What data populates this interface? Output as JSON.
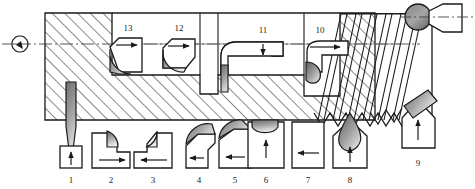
{
  "diagram": {
    "type": "engineering-sectional-drawing",
    "colors": {
      "outline": "#1a1a1a",
      "hatch": "#2b2b2b",
      "insert_dark": "#6d6d6d",
      "insert_light": "#e8e8e8",
      "centerline": "#444444",
      "background": "#ffffff"
    },
    "axis": {
      "centerline_label": "",
      "symbol": "center-mark"
    },
    "workpiece": {
      "section_hatch": "45-degree-hatch",
      "features": [
        "bore",
        "counterbore",
        "groove",
        "thread",
        "chamfer",
        "ball-end"
      ]
    },
    "tools_bottom": [
      {
        "id": "1",
        "label": "1",
        "feed": "up",
        "kind": "drill"
      },
      {
        "id": "2",
        "label": "2",
        "feed": "right",
        "kind": "round-insert-turning"
      },
      {
        "id": "3",
        "label": "3",
        "feed": "right",
        "kind": "round-insert-turning"
      },
      {
        "id": "4",
        "label": "4",
        "feed": "left",
        "kind": "round-insert-facing"
      },
      {
        "id": "5",
        "label": "5",
        "feed": "left",
        "kind": "round-insert-facing"
      },
      {
        "id": "6",
        "label": "6",
        "feed": "up",
        "kind": "form-tool-concave"
      },
      {
        "id": "7",
        "label": "7",
        "feed": "left",
        "kind": "grooving-tool"
      },
      {
        "id": "8",
        "label": "8",
        "feed": "up",
        "kind": "thread-chaser"
      },
      {
        "id": "9",
        "label": "9",
        "feed": "up",
        "kind": "chamfer-tool-angled"
      }
    ],
    "tools_top": [
      {
        "id": "10",
        "label": "10",
        "feed": "right",
        "kind": "boring-bar-threading"
      },
      {
        "id": "11",
        "label": "11",
        "feed": "down",
        "kind": "boring-bar-facing"
      },
      {
        "id": "12",
        "label": "12",
        "feed": "right",
        "kind": "boring-bar-round-insert"
      },
      {
        "id": "13",
        "label": "13",
        "feed": "right",
        "kind": "boring-bar-round-insert"
      }
    ]
  }
}
